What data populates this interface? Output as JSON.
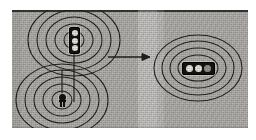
{
  "figure": {
    "background_color": "#b9b7b3",
    "line_color": "#24231f",
    "page_color": "#ffffff"
  },
  "plate": {
    "x": 12,
    "y": 10,
    "width": 236,
    "height": 118,
    "top_rule_color": "#3a3936",
    "light_band": {
      "x": 126,
      "width": 19,
      "label": "lighter vertical band"
    },
    "dark_band": {
      "x": 0,
      "width": 9,
      "label": "darker left band"
    }
  },
  "ring_groups": [
    {
      "name": "upper-left-rings",
      "center_x": 62,
      "center_y": 30,
      "ring_count": 5,
      "radii_x": [
        10,
        19,
        28,
        37,
        46
      ],
      "radii_y": [
        9,
        16,
        23,
        30,
        36
      ]
    },
    {
      "name": "lower-left-rings",
      "center_x": 50,
      "center_y": 90,
      "ring_count": 5,
      "radii_x": [
        10,
        19,
        28,
        37,
        46
      ],
      "radii_y": [
        9,
        16,
        23,
        30,
        36
      ]
    },
    {
      "name": "right-rings",
      "center_x": 186,
      "center_y": 58,
      "ring_count": 4,
      "radii_x": [
        20,
        28,
        36,
        44
      ],
      "radii_y": [
        13,
        20,
        27,
        33
      ]
    }
  ],
  "connector": {
    "name": "vertical-connector",
    "x": 62,
    "y_start": 30,
    "y_end": 90
  },
  "arrow": {
    "name": "transform-arrow",
    "direction": "right",
    "x_start": 96,
    "x_end": 142,
    "y": 57,
    "label": ""
  },
  "signals": [
    {
      "name": "vertical-traffic-signal",
      "orientation": "vertical",
      "x": 57,
      "y": 17,
      "lamps": [
        "lamp-top",
        "lamp-middle",
        "lamp-bottom"
      ],
      "lamp_color": "#f3f2ee",
      "body_color": "#16150f"
    },
    {
      "name": "horizontal-traffic-signal",
      "orientation": "horizontal",
      "x": 170,
      "y": 52,
      "lamps": [
        "lamp-left",
        "lamp-center",
        "lamp-right"
      ],
      "lamp_color": "#f3f2ee",
      "body_color": "#16150f"
    }
  ],
  "post_marker": {
    "name": "post-marker",
    "x": 46,
    "y": 84,
    "description": "small dark post with round head at lower-left ring centre"
  }
}
